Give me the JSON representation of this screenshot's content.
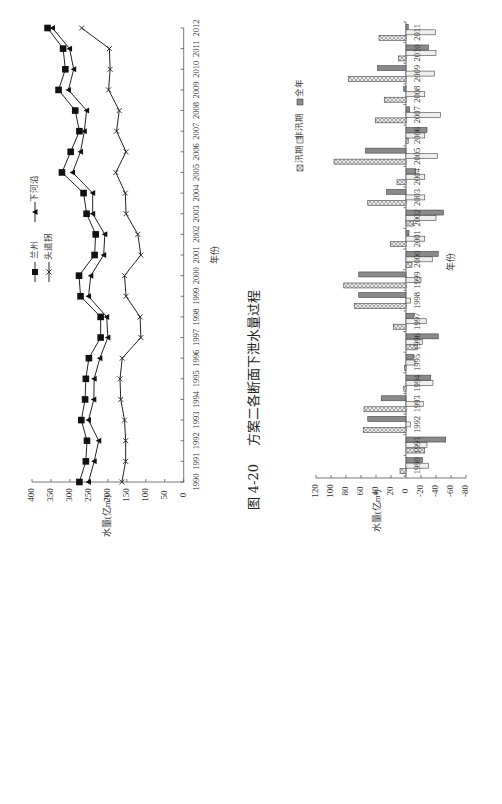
{
  "caption": {
    "figure_no": "图 4-20",
    "title": "方案二各断面下泄水量过程"
  },
  "colors": {
    "line": "#222222",
    "axis": "#555555",
    "bar_flood_fill": "#d8d8d8",
    "bar_nonflood_fill": "#eeeeee",
    "bar_annual_fill": "#8a8a8a"
  },
  "chart_data": [
    {
      "type": "line",
      "title": "",
      "xlabel": "年份",
      "ylabel": "水量(亿m³)",
      "ylim": [
        0,
        400
      ],
      "yticks": [
        0,
        50,
        100,
        150,
        200,
        250,
        300,
        350,
        400
      ],
      "grid": false,
      "legend_position": "upper-left (rotated)",
      "categories": [
        "1990",
        "1991",
        "1992",
        "1993",
        "1994",
        "1995",
        "1996",
        "1997",
        "1998",
        "1999",
        "2000",
        "2001",
        "2002",
        "2003",
        "2004",
        "2005",
        "2006",
        "2007",
        "2008",
        "2009",
        "2010",
        "2011",
        "2012"
      ],
      "series": [
        {
          "name": "兰州",
          "marker": "square",
          "values": [
            275,
            258,
            255,
            270,
            260,
            258,
            250,
            219,
            219,
            272,
            276,
            235,
            232,
            256,
            264,
            321,
            298,
            275,
            286,
            330,
            312,
            318,
            359
          ]
        },
        {
          "name": "头道拐",
          "marker": "x",
          "values": [
            163,
            153,
            153,
            156,
            166,
            168,
            162,
            113,
            115,
            152,
            156,
            113,
            121,
            152,
            154,
            179,
            152,
            177,
            170,
            198,
            194,
            196,
            269
          ]
        },
        {
          "name": "下河沿",
          "marker": "triangle",
          "values": [
            251,
            236,
            224,
            251,
            237,
            236,
            221,
            200,
            203,
            251,
            245,
            211,
            208,
            240,
            240,
            293,
            272,
            262,
            256,
            304,
            290,
            301,
            346
          ]
        }
      ]
    },
    {
      "type": "bar",
      "title": "",
      "xlabel": "年份",
      "ylabel": "水量(亿m³)",
      "ylim": [
        -80,
        120
      ],
      "yticks": [
        120,
        100,
        80,
        60,
        40,
        20,
        0,
        -20,
        -40,
        -60,
        -80
      ],
      "grid": false,
      "legend_position": "top (rotated)",
      "categories": [
        "1990",
        "1991",
        "1992",
        "1993",
        "1994",
        "1995",
        "1996",
        "1997",
        "1998",
        "1999",
        "2000",
        "2001",
        "2002",
        "2003",
        "2004",
        "2005",
        "2006",
        "2007",
        "2008",
        "2009",
        "2010",
        "2011"
      ],
      "series": [
        {
          "name": "汛期",
          "pattern": "hatch",
          "values": [
            8,
            -25,
            57,
            56,
            3,
            2,
            -15,
            17,
            69,
            83,
            -8,
            21,
            -10,
            51,
            12,
            96,
            -3,
            41,
            29,
            77,
            10,
            36
          ]
        },
        {
          "name": "非汛期",
          "pattern": "light",
          "values": [
            -30,
            -28,
            -6,
            -23,
            -36,
            -12,
            -22,
            -27,
            -6,
            -20,
            -35,
            -25,
            -40,
            -25,
            -25,
            -42,
            -25,
            -46,
            -25,
            -38,
            -40,
            -39
          ]
        },
        {
          "name": "全年",
          "pattern": "dark",
          "values": [
            -22,
            -53,
            51,
            33,
            -33,
            -10,
            -43,
            -10,
            63,
            63,
            -43,
            -4,
            -50,
            26,
            -13,
            54,
            -28,
            -5,
            3,
            38,
            -30,
            -3
          ]
        }
      ]
    }
  ]
}
